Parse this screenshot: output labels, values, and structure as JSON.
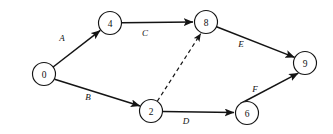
{
  "diagram": {
    "type": "directed-graph",
    "background_color": "#ffffff",
    "line_color": "#141414",
    "canvas": {
      "width": 333,
      "height": 134
    },
    "nodes": [
      {
        "id": "0",
        "label": "0",
        "cx": 44,
        "cy": 74,
        "r": 11.5
      },
      {
        "id": "4",
        "label": "4",
        "cx": 110,
        "cy": 23,
        "r": 11.5
      },
      {
        "id": "8",
        "label": "8",
        "cx": 206,
        "cy": 22,
        "r": 11.5
      },
      {
        "id": "9",
        "label": "9",
        "cx": 305,
        "cy": 63,
        "r": 11.5
      },
      {
        "id": "2",
        "label": "2",
        "cx": 151,
        "cy": 111,
        "r": 11.5
      },
      {
        "id": "6",
        "label": "6",
        "cx": 247,
        "cy": 113,
        "r": 11.5
      }
    ],
    "edges": [
      {
        "id": "A",
        "label": "A",
        "from": "0",
        "to": "4",
        "style": "solid",
        "arrow": true,
        "label_x": 62,
        "label_y": 38
      },
      {
        "id": "B",
        "label": "B",
        "from": "0",
        "to": "2",
        "style": "solid",
        "arrow": true,
        "label_x": 88,
        "label_y": 97
      },
      {
        "id": "C",
        "label": "C",
        "from": "4",
        "to": "8",
        "style": "solid",
        "arrow": true,
        "label_x": 145,
        "label_y": 33
      },
      {
        "id": "E",
        "label": "E",
        "from": "8",
        "to": "9",
        "style": "solid",
        "arrow": true,
        "label_x": 241,
        "label_y": 44
      },
      {
        "id": "D",
        "label": "D",
        "from": "2",
        "to": "6",
        "style": "solid",
        "arrow": true,
        "label_x": 186,
        "label_y": 121
      },
      {
        "id": "F",
        "label": "F",
        "from": "6",
        "to": "9",
        "style": "solid",
        "arrow": true,
        "label_x": 255,
        "label_y": 89
      },
      {
        "id": "dummy",
        "label": "",
        "from": "2",
        "to": "8",
        "style": "dashed",
        "arrow": true,
        "label_x": 0,
        "label_y": 0
      }
    ]
  }
}
